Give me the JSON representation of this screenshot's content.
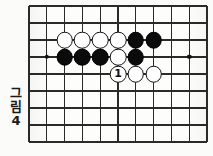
{
  "figure": {
    "caption_char_1": "그",
    "caption_char_2": "림",
    "caption_number": "4"
  },
  "board": {
    "columns": 11,
    "rows": 9,
    "line_color": "#2a2a2a",
    "border_color": "#1b1b1b",
    "background_color": "#fdfdfb",
    "star_points": [
      {
        "name": "star-point-left",
        "col": 1,
        "row": 3
      },
      {
        "name": "star-point-right",
        "col": 9,
        "row": 3
      }
    ],
    "stones": [
      {
        "name": "white-stone-r2c2",
        "color": "white",
        "col": 2,
        "row": 2,
        "label": ""
      },
      {
        "name": "white-stone-r2c3",
        "color": "white",
        "col": 3,
        "row": 2,
        "label": ""
      },
      {
        "name": "white-stone-r2c4",
        "color": "white",
        "col": 4,
        "row": 2,
        "label": ""
      },
      {
        "name": "white-stone-r2c5",
        "color": "white",
        "col": 5,
        "row": 2,
        "label": ""
      },
      {
        "name": "black-stone-r2c6",
        "color": "black",
        "col": 6,
        "row": 2,
        "label": ""
      },
      {
        "name": "black-stone-r2c7",
        "color": "black",
        "col": 7,
        "row": 2,
        "label": ""
      },
      {
        "name": "black-stone-r3c2",
        "color": "black",
        "col": 2,
        "row": 3,
        "label": ""
      },
      {
        "name": "black-stone-r3c3",
        "color": "black",
        "col": 3,
        "row": 3,
        "label": ""
      },
      {
        "name": "black-stone-r3c4",
        "color": "black",
        "col": 4,
        "row": 3,
        "label": ""
      },
      {
        "name": "white-stone-r3c5",
        "color": "white",
        "col": 5,
        "row": 3,
        "label": ""
      },
      {
        "name": "black-stone-r3c6",
        "color": "black",
        "col": 6,
        "row": 3,
        "label": ""
      },
      {
        "name": "white-stone-move-1",
        "color": "white",
        "col": 5,
        "row": 4,
        "label": "1"
      },
      {
        "name": "white-stone-r4c6",
        "color": "white",
        "col": 6,
        "row": 4,
        "label": ""
      },
      {
        "name": "white-stone-r4c7",
        "color": "white",
        "col": 7,
        "row": 4,
        "label": ""
      }
    ]
  }
}
